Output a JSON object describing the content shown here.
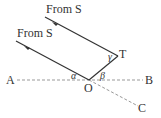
{
  "diagram": {
    "rays": [
      {
        "label": "From S",
        "from": "S",
        "to": "T"
      },
      {
        "label": "From S",
        "from": "S",
        "to": "O"
      }
    ],
    "points": {
      "A": "A",
      "B": "B",
      "O": "O",
      "T": "T",
      "C": "C"
    },
    "angles": {
      "alpha": "α",
      "beta": "β",
      "gamma": "γ"
    },
    "colors": {
      "solid_line": "#333333",
      "dashed_line": "#999999",
      "text": "#333333"
    }
  }
}
